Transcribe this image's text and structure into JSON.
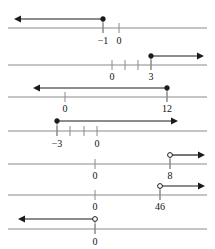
{
  "figure": {
    "type": "number-line-set",
    "count": 7,
    "colors": {
      "axis": "#8a8a8a",
      "ray": "#1b1b1b",
      "label": "#111111",
      "background": "#ffffff"
    }
  },
  "lines": [
    {
      "id": "line-1",
      "axis_y": 28,
      "ray_y": 19,
      "endpoint": {
        "value": "-1",
        "x": 103,
        "marker": "closed"
      },
      "direction": "left",
      "ray_from_x": 103,
      "ray_to_x": 14,
      "labels": [
        {
          "text": "-1",
          "x": 103,
          "y": 44
        },
        {
          "text": "0",
          "x": 119,
          "y": 44
        }
      ],
      "ticks": [
        {
          "value": "-1",
          "x": 103
        },
        {
          "value": "0",
          "x": 119
        }
      ],
      "axis_from_x": 8,
      "axis_to_x": 207
    },
    {
      "id": "line-2",
      "axis_y": 65,
      "ray_y": 56,
      "endpoint": {
        "value": "3",
        "x": 151,
        "marker": "closed"
      },
      "direction": "right",
      "ray_from_x": 151,
      "ray_to_x": 204,
      "labels": [
        {
          "text": "0",
          "x": 112,
          "y": 80
        },
        {
          "text": "3",
          "x": 151,
          "y": 80
        }
      ],
      "ticks": [
        {
          "value": "0",
          "x": 112
        },
        {
          "value": "1",
          "x": 125
        },
        {
          "value": "2",
          "x": 138
        },
        {
          "value": "3",
          "x": 151
        }
      ],
      "axis_from_x": 8,
      "axis_to_x": 207
    },
    {
      "id": "line-3",
      "axis_y": 97,
      "ray_y": 88,
      "endpoint": {
        "value": "12",
        "x": 167,
        "marker": "closed"
      },
      "direction": "left",
      "ray_from_x": 167,
      "ray_to_x": 33,
      "labels": [
        {
          "text": "0",
          "x": 65,
          "y": 112
        },
        {
          "text": "12",
          "x": 167,
          "y": 112
        }
      ],
      "ticks": [
        {
          "value": "0",
          "x": 65
        },
        {
          "value": "12",
          "x": 167
        }
      ],
      "axis_from_x": 8,
      "axis_to_x": 207
    },
    {
      "id": "line-4",
      "axis_y": 131,
      "ray_y": 121,
      "endpoint": {
        "value": "-3",
        "x": 57,
        "marker": "closed"
      },
      "direction": "right",
      "ray_from_x": 57,
      "ray_to_x": 178,
      "labels": [
        {
          "text": "-3",
          "x": 57,
          "y": 147
        },
        {
          "text": "0",
          "x": 97,
          "y": 147
        }
      ],
      "ticks": [
        {
          "value": "-3",
          "x": 57
        },
        {
          "value": "-2",
          "x": 70
        },
        {
          "value": "-1",
          "x": 84
        },
        {
          "value": "0",
          "x": 97
        }
      ],
      "axis_from_x": 8,
      "axis_to_x": 207
    },
    {
      "id": "line-5",
      "axis_y": 164,
      "ray_y": 155,
      "endpoint": {
        "value": "8",
        "x": 170,
        "marker": "open"
      },
      "direction": "right",
      "ray_from_x": 170,
      "ray_to_x": 205,
      "labels": [
        {
          "text": "0",
          "x": 95,
          "y": 179
        },
        {
          "text": "8",
          "x": 170,
          "y": 179
        }
      ],
      "ticks": [
        {
          "value": "0",
          "x": 95
        },
        {
          "value": "8",
          "x": 170
        }
      ],
      "axis_from_x": 8,
      "axis_to_x": 207
    },
    {
      "id": "line-6",
      "axis_y": 195,
      "ray_y": 186,
      "endpoint": {
        "value": "46",
        "x": 160,
        "marker": "open"
      },
      "direction": "right",
      "ray_from_x": 160,
      "ray_to_x": 205,
      "labels": [
        {
          "text": "0",
          "x": 95,
          "y": 210
        },
        {
          "text": "46",
          "x": 160,
          "y": 210
        }
      ],
      "ticks": [
        {
          "value": "0",
          "x": 95
        },
        {
          "value": "46",
          "x": 160
        }
      ],
      "axis_from_x": 8,
      "axis_to_x": 207
    },
    {
      "id": "line-7",
      "axis_y": 229,
      "ray_y": 219,
      "endpoint": {
        "value": "0",
        "x": 95,
        "marker": "open"
      },
      "direction": "left",
      "ray_from_x": 95,
      "ray_to_x": 18,
      "labels": [
        {
          "text": "0",
          "x": 95,
          "y": 245
        }
      ],
      "ticks": [
        {
          "value": "0",
          "x": 95
        }
      ],
      "axis_from_x": 8,
      "axis_to_x": 207
    }
  ]
}
